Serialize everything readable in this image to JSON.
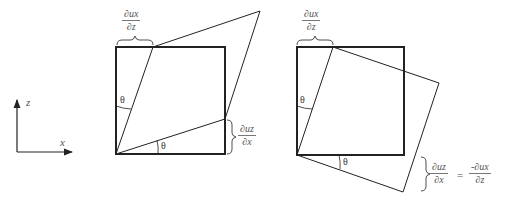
{
  "axes": {
    "x_label": "x",
    "z_label": "z"
  },
  "left_panel": {
    "top_fraction": {
      "num": "∂u_x",
      "den": "∂z",
      "num_text": "∂ux",
      "den_text": "∂z"
    },
    "right_fraction": {
      "num_text": "∂uz",
      "den_text": "∂x"
    },
    "theta_top": "θ",
    "theta_bottom": "θ"
  },
  "right_panel": {
    "top_fraction": {
      "num_text": "∂ux",
      "den_text": "∂z"
    },
    "bottom_equation": {
      "lhs_num": "∂uz",
      "lhs_den": "∂x",
      "equals": "=",
      "rhs_num": "-∂ux",
      "rhs_den": "∂z"
    },
    "theta_top": "θ",
    "theta_bottom": "θ"
  },
  "colors": {
    "stroke": "#222222",
    "text": "#555555"
  }
}
